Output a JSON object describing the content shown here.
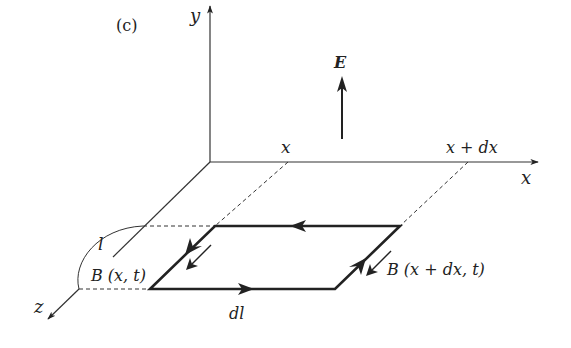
{
  "figure": {
    "panel_label": "(c)",
    "axes": {
      "x_label": "x",
      "y_label": "y",
      "z_label": "z"
    },
    "field": {
      "label": "E"
    },
    "positions": {
      "x_left": "x",
      "x_right": "x + dx"
    },
    "loop": {
      "length_label": "l",
      "element_label": "dl"
    },
    "magnetic_field": {
      "left_label": "B (x, t)",
      "right_label": "B (x + dx, t)"
    }
  }
}
